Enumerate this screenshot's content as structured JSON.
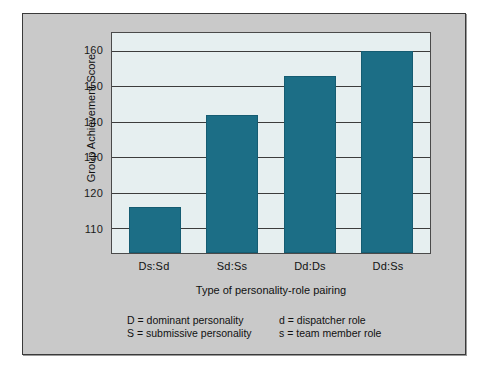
{
  "chart_data": {
    "type": "bar",
    "title": "",
    "categories": [
      "Ds:Sd",
      "Sd:Ss",
      "Dd:Ds",
      "Dd:Ss"
    ],
    "values": [
      116,
      142,
      153,
      160
    ],
    "xlabel": "Type of personality-role pairing",
    "ylabel": "Group Achievement Score",
    "ylim": [
      103,
      165
    ],
    "yticks": [
      110,
      120,
      130,
      140,
      150,
      160
    ],
    "ytick_labels": [
      "110",
      "120",
      "130",
      "140",
      "150",
      "160"
    ],
    "grid": true,
    "grid_axis": "y",
    "legend": "none",
    "bar_color": "#1c6e86",
    "plot_background": "#e6eff0",
    "figure_background": "#c9c9c9",
    "annotations": [
      "D = dominant personality",
      "S = submissive personality",
      "d = dispatcher role",
      "s = team member role"
    ]
  },
  "axes": {
    "y_title": "Group Achievement Score",
    "x_title": "Type of personality-role pairing",
    "y_labels": [
      "160",
      "150",
      "140",
      "130",
      "120",
      "110"
    ],
    "x_labels": [
      "Ds:Sd",
      "Sd:Ss",
      "Dd:Ds",
      "Dd:Ss"
    ]
  },
  "key": {
    "rows": [
      {
        "left": "D = dominant personality",
        "right": "d = dispatcher role"
      },
      {
        "left": "S = submissive personality",
        "right": "s = team member role"
      }
    ]
  }
}
